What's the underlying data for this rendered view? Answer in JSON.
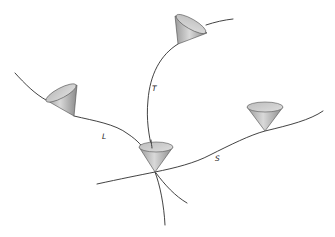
{
  "diagram": {
    "title": "",
    "type": "light cones along world lines",
    "colors": {
      "background": "#ffffff",
      "line": "#2e2e2e",
      "cone_dark": "#8c8c8c",
      "cone_light": "#d6d6d6",
      "rim": "#c4c4c4"
    },
    "curves": [
      {
        "id": "T",
        "label": "T",
        "label_pos": [
          152,
          91
        ]
      },
      {
        "id": "L",
        "label": "L",
        "label_pos": [
          102,
          138
        ]
      },
      {
        "id": "S",
        "label": "S",
        "label_pos": [
          215,
          160
        ]
      }
    ],
    "cones": [
      {
        "id": "cone-top",
        "on_curve": "T"
      },
      {
        "id": "cone-left",
        "on_curve": "L"
      },
      {
        "id": "cone-center",
        "on_curve": "intersection"
      },
      {
        "id": "cone-right",
        "on_curve": "S"
      }
    ]
  }
}
